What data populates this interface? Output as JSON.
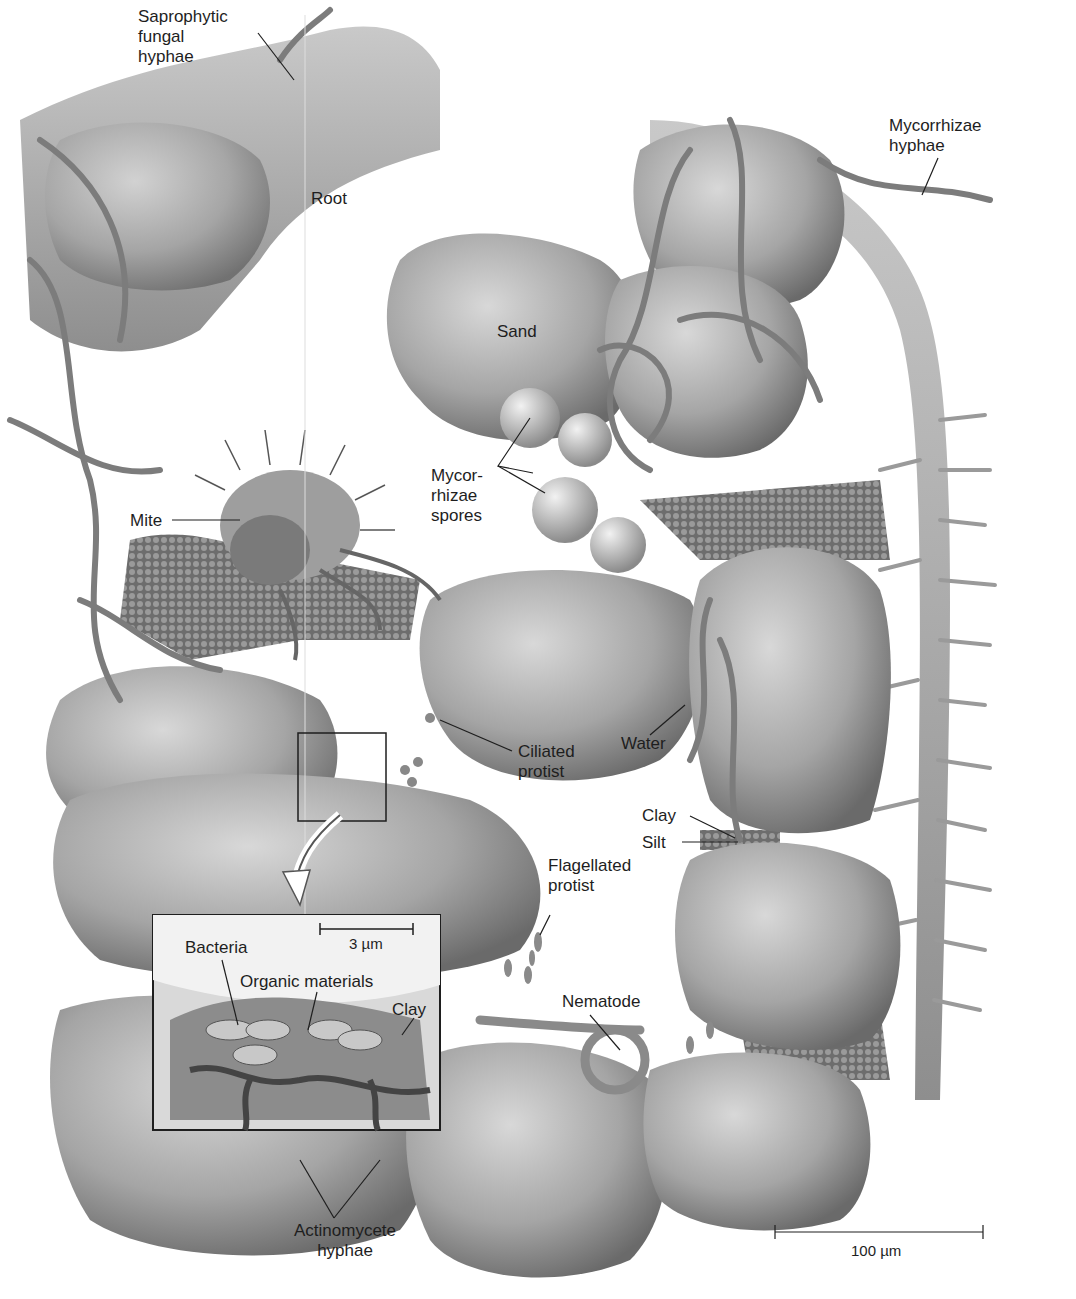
{
  "figure": {
    "labels": {
      "saprophytic": "Saprophytic\nfungal\nhyphae",
      "root": "Root",
      "mycorrhizae_hyphae": "Mycorrhizae\nhyphae",
      "sand": "Sand",
      "mycorrhizae_spores": "Mycor-\nrhizae\nspores",
      "mite": "Mite",
      "ciliated_protist": "Ciliated\nprotist",
      "water": "Water",
      "clay": "Clay",
      "silt": "Silt",
      "flagellated_protist": "Flagellated\nprotist",
      "nematode": "Nematode",
      "actinomycete_hyphae": "Actinomycete\nhyphae"
    },
    "inset": {
      "scale_bar": "3 µm",
      "bacteria": "Bacteria",
      "organic_materials": "Organic materials",
      "clay": "Clay"
    },
    "scale_bar": "100 µm",
    "colors": {
      "particle_fill": "#a9a9a9",
      "particle_shadow": "#6e6e6e",
      "root_fill": "#b8b8b8",
      "hyphae": "#8a8a8a",
      "background": "#ffffff",
      "line": "#1e1e1e"
    }
  }
}
